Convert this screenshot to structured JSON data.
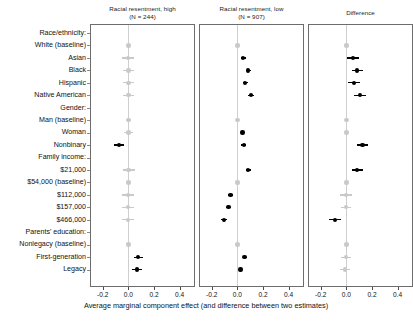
{
  "figure": {
    "axis_caption": "Average marginal component effect (and difference between two estimates)",
    "x_ticks": [
      "-0.2",
      "0.0",
      "0.2",
      "0.4"
    ],
    "x_tick_values": [
      -0.2,
      0.0,
      0.2,
      0.4
    ],
    "xlim": [
      -0.3,
      0.52
    ]
  },
  "row_labels": [
    "Race/ethnicity:",
    "White (baseline)",
    "Asian",
    "Black",
    "Hispanic",
    "Native American",
    "Gender:",
    "Man (baseline)",
    "Woman",
    "Nonbinary",
    "Family income:",
    "$21,000",
    "$54,000 (baseline)",
    "$112,000",
    "$157,000",
    "$466,000",
    "Parents' education:",
    "Nonlegacy (baseline)",
    "First-generation",
    "Legacy"
  ],
  "chart_data": {
    "type": "scatter",
    "title": "",
    "xlabel": "Average marginal component effect (and difference between two estimates)",
    "ylabel": "",
    "xlim": [
      -0.3,
      0.52
    ],
    "xticks": [
      -0.2,
      0.0,
      0.2,
      0.4
    ],
    "grid": false,
    "legend": "none",
    "orientation": "horizontal-forest",
    "categories": [
      "Race/ethnicity:",
      "White (baseline)",
      "Asian",
      "Black",
      "Hispanic",
      "Native American",
      "Gender:",
      "Man (baseline)",
      "Woman",
      "Nonbinary",
      "Family income:",
      "$21,000",
      "$54,000 (baseline)",
      "$112,000",
      "$157,000",
      "$466,000",
      "Parents' education:",
      "Nonlegacy (baseline)",
      "First-generation",
      "Legacy"
    ],
    "panels": [
      {
        "name": "panel-high",
        "title_line1": "Racial resentment, high",
        "title_line2": "(N = 244)",
        "n": 244,
        "points": [
          {
            "category": "Race/ethnicity:",
            "header": true
          },
          {
            "category": "White (baseline)",
            "estimate": 0.0,
            "ci_low": 0.0,
            "ci_high": 0.0,
            "significant": false
          },
          {
            "category": "Asian",
            "estimate": -0.005,
            "ci_low": -0.05,
            "ci_high": 0.04,
            "significant": false
          },
          {
            "category": "Black",
            "estimate": 0.0,
            "ci_low": -0.045,
            "ci_high": 0.045,
            "significant": false
          },
          {
            "category": "Hispanic",
            "estimate": 0.0,
            "ci_low": -0.045,
            "ci_high": 0.045,
            "significant": false
          },
          {
            "category": "Native American",
            "estimate": 0.0,
            "ci_low": -0.045,
            "ci_high": 0.045,
            "significant": false
          },
          {
            "category": "Gender:",
            "header": true
          },
          {
            "category": "Man (baseline)",
            "estimate": 0.0,
            "ci_low": 0.0,
            "ci_high": 0.0,
            "significant": false
          },
          {
            "category": "Woman",
            "estimate": 0.0,
            "ci_low": -0.035,
            "ci_high": 0.035,
            "significant": false
          },
          {
            "category": "Nonbinary",
            "estimate": -0.075,
            "ci_low": -0.115,
            "ci_high": -0.035,
            "significant": true
          },
          {
            "category": "Family income:",
            "header": true
          },
          {
            "category": "$21,000",
            "estimate": 0.0,
            "ci_low": -0.045,
            "ci_high": 0.05,
            "significant": false
          },
          {
            "category": "$54,000 (baseline)",
            "estimate": 0.0,
            "ci_low": 0.0,
            "ci_high": 0.0,
            "significant": false
          },
          {
            "category": "$112,000",
            "estimate": -0.005,
            "ci_low": -0.05,
            "ci_high": 0.045,
            "significant": false
          },
          {
            "category": "$157,000",
            "estimate": -0.005,
            "ci_low": -0.05,
            "ci_high": 0.045,
            "significant": false
          },
          {
            "category": "$466,000",
            "estimate": -0.005,
            "ci_low": -0.05,
            "ci_high": 0.045,
            "significant": false
          },
          {
            "category": "Parents' education:",
            "header": true
          },
          {
            "category": "Nonlegacy (baseline)",
            "estimate": 0.0,
            "ci_low": 0.0,
            "ci_high": 0.0,
            "significant": false
          },
          {
            "category": "First-generation",
            "estimate": 0.075,
            "ci_low": 0.04,
            "ci_high": 0.115,
            "significant": true
          },
          {
            "category": "Legacy",
            "estimate": 0.065,
            "ci_low": 0.03,
            "ci_high": 0.105,
            "significant": true
          }
        ]
      },
      {
        "name": "panel-low",
        "title_line1": "Racial resentment, low",
        "title_line2": "(N = 907)",
        "n": 907,
        "points": [
          {
            "category": "Race/ethnicity:",
            "header": true
          },
          {
            "category": "White (baseline)",
            "estimate": 0.0,
            "ci_low": 0.0,
            "ci_high": 0.0,
            "significant": false
          },
          {
            "category": "Asian",
            "estimate": 0.045,
            "ci_low": 0.025,
            "ci_high": 0.065,
            "significant": true
          },
          {
            "category": "Black",
            "estimate": 0.085,
            "ci_low": 0.065,
            "ci_high": 0.105,
            "significant": true
          },
          {
            "category": "Hispanic",
            "estimate": 0.06,
            "ci_low": 0.04,
            "ci_high": 0.08,
            "significant": true
          },
          {
            "category": "Native American",
            "estimate": 0.105,
            "ci_low": 0.08,
            "ci_high": 0.13,
            "significant": true
          },
          {
            "category": "Gender:",
            "header": true
          },
          {
            "category": "Man (baseline)",
            "estimate": 0.0,
            "ci_low": 0.0,
            "ci_high": 0.0,
            "significant": false
          },
          {
            "category": "Woman",
            "estimate": 0.04,
            "ci_low": 0.025,
            "ci_high": 0.055,
            "significant": true
          },
          {
            "category": "Nonbinary",
            "estimate": 0.05,
            "ci_low": 0.03,
            "ci_high": 0.07,
            "significant": true
          },
          {
            "category": "Family income:",
            "header": true
          },
          {
            "category": "$21,000",
            "estimate": 0.085,
            "ci_low": 0.065,
            "ci_high": 0.105,
            "significant": true
          },
          {
            "category": "$54,000 (baseline)",
            "estimate": 0.0,
            "ci_low": 0.0,
            "ci_high": 0.0,
            "significant": false
          },
          {
            "category": "$112,000",
            "estimate": -0.055,
            "ci_low": -0.075,
            "ci_high": -0.035,
            "significant": true
          },
          {
            "category": "$157,000",
            "estimate": -0.07,
            "ci_low": -0.09,
            "ci_high": -0.05,
            "significant": true
          },
          {
            "category": "$466,000",
            "estimate": -0.105,
            "ci_low": -0.13,
            "ci_high": -0.085,
            "significant": true
          },
          {
            "category": "Parents' education:",
            "header": true
          },
          {
            "category": "Nonlegacy (baseline)",
            "estimate": 0.0,
            "ci_low": 0.0,
            "ci_high": 0.0,
            "significant": false
          },
          {
            "category": "First-generation",
            "estimate": 0.055,
            "ci_low": 0.04,
            "ci_high": 0.075,
            "significant": true
          },
          {
            "category": "Legacy",
            "estimate": 0.025,
            "ci_low": 0.01,
            "ci_high": 0.045,
            "significant": true
          }
        ]
      },
      {
        "name": "panel-difference",
        "title_line1": "Difference",
        "title_line2": "",
        "points": [
          {
            "category": "Race/ethnicity:",
            "header": true
          },
          {
            "category": "White (baseline)",
            "estimate": 0.0,
            "ci_low": 0.0,
            "ci_high": 0.0,
            "significant": false
          },
          {
            "category": "Asian",
            "estimate": 0.05,
            "ci_low": 0.005,
            "ci_high": 0.095,
            "significant": true
          },
          {
            "category": "Black",
            "estimate": 0.085,
            "ci_low": 0.04,
            "ci_high": 0.13,
            "significant": true
          },
          {
            "category": "Hispanic",
            "estimate": 0.06,
            "ci_low": 0.015,
            "ci_high": 0.105,
            "significant": true
          },
          {
            "category": "Native American",
            "estimate": 0.105,
            "ci_low": 0.06,
            "ci_high": 0.15,
            "significant": true
          },
          {
            "category": "Gender:",
            "header": true
          },
          {
            "category": "Man (baseline)",
            "estimate": 0.0,
            "ci_low": 0.0,
            "ci_high": 0.0,
            "significant": false
          },
          {
            "category": "Woman",
            "estimate": 0.0,
            "ci_low": -0.02,
            "ci_high": 0.02,
            "significant": false
          },
          {
            "category": "Nonbinary",
            "estimate": 0.125,
            "ci_low": 0.08,
            "ci_high": 0.17,
            "significant": true
          },
          {
            "category": "Family income:",
            "header": true
          },
          {
            "category": "$21,000",
            "estimate": 0.085,
            "ci_low": 0.04,
            "ci_high": 0.13,
            "significant": true
          },
          {
            "category": "$54,000 (baseline)",
            "estimate": 0.0,
            "ci_low": 0.0,
            "ci_high": 0.0,
            "significant": false
          },
          {
            "category": "$112,000",
            "estimate": -0.005,
            "ci_low": -0.05,
            "ci_high": 0.04,
            "significant": false
          },
          {
            "category": "$157,000",
            "estimate": -0.005,
            "ci_low": -0.045,
            "ci_high": 0.035,
            "significant": false
          },
          {
            "category": "$466,000",
            "estimate": -0.09,
            "ci_low": -0.135,
            "ci_high": -0.045,
            "significant": true
          },
          {
            "category": "Parents' education:",
            "header": true
          },
          {
            "category": "Nonlegacy (baseline)",
            "estimate": 0.0,
            "ci_low": 0.0,
            "ci_high": 0.0,
            "significant": false
          },
          {
            "category": "First-generation",
            "estimate": -0.005,
            "ci_low": -0.045,
            "ci_high": 0.035,
            "significant": false
          },
          {
            "category": "Legacy",
            "estimate": -0.01,
            "ci_low": -0.05,
            "ci_high": 0.03,
            "significant": false
          }
        ]
      }
    ]
  }
}
